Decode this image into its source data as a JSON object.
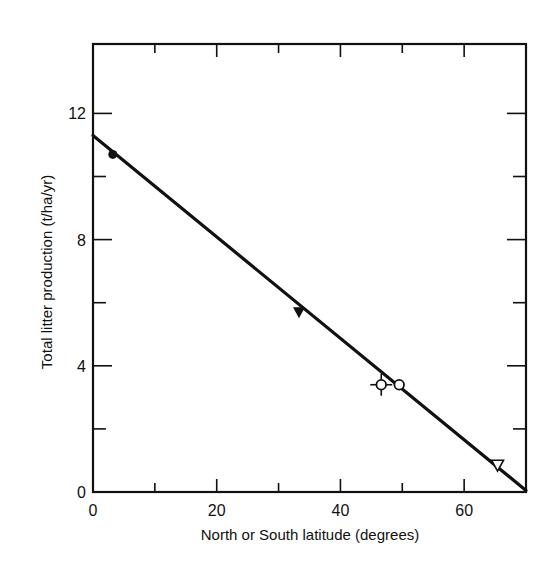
{
  "chart_data": {
    "type": "scatter",
    "title": "",
    "xlabel": "North or South latitude (degrees)",
    "ylabel": "Total litter production (t/ha/yr)",
    "xlim": [
      0,
      70
    ],
    "ylim": [
      0,
      14.2
    ],
    "x_ticks": [
      0,
      20,
      40,
      60
    ],
    "x_minor_ticks": [
      10,
      30,
      50
    ],
    "y_ticks": [
      0,
      4,
      8,
      12
    ],
    "y_minor_ticks": [
      2,
      6,
      10
    ],
    "grid": false,
    "legend": null,
    "series": [
      {
        "name": "filled circle",
        "marker": "filled-circle",
        "points": [
          {
            "x": 3.2,
            "y": 10.7
          }
        ]
      },
      {
        "name": "filled triangle",
        "marker": "filled-triangle-down",
        "points": [
          {
            "x": 33.3,
            "y": 5.7
          }
        ]
      },
      {
        "name": "open circle with error bars",
        "marker": "open-circle-crosshair",
        "points": [
          {
            "x": 46.6,
            "y": 3.4
          }
        ]
      },
      {
        "name": "open circle",
        "marker": "open-circle",
        "points": [
          {
            "x": 49.5,
            "y": 3.4
          }
        ]
      },
      {
        "name": "open triangle",
        "marker": "open-triangle-down",
        "points": [
          {
            "x": 65.4,
            "y": 0.85
          }
        ]
      }
    ],
    "fit_line": {
      "name": "regression line",
      "x": [
        0,
        70
      ],
      "y": [
        11.3,
        0.05
      ]
    }
  },
  "axes": {
    "x_tick_labels": [
      "0",
      "20",
      "40",
      "60"
    ],
    "y_tick_labels": [
      "0",
      "4",
      "8",
      "12"
    ]
  }
}
